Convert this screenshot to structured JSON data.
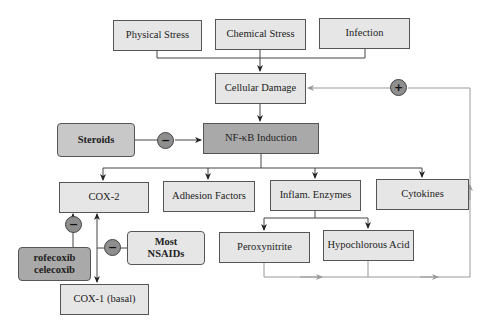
{
  "diagram": {
    "nodes": {
      "physical_stress": "Physical Stress",
      "chemical_stress": "Chemical Stress",
      "infection": "Infection",
      "cellular_damage": "Cellular Damage",
      "nfkb": "NF-κB Induction",
      "steroids": "Steroids",
      "cox2": "COX-2",
      "adhesion": "Adhesion Factors",
      "enzymes": "Inflam. Enzymes",
      "cytokines": "Cytokines",
      "coxibs_line1": "rofecoxib",
      "coxibs_line2": "celecoxib",
      "nsaids_line1": "Most",
      "nsaids_line2": "NSAIDs",
      "peroxynitrite": "Peroxynitrite",
      "hypochlorous": "Hypochlorous Acid",
      "cox1": "COX-1 (basal)"
    },
    "signs": {
      "positive": "+",
      "negative": "−"
    },
    "edges": [
      {
        "from": "Physical Stress",
        "to": "Cellular Damage",
        "type": "activation"
      },
      {
        "from": "Chemical Stress",
        "to": "Cellular Damage",
        "type": "activation"
      },
      {
        "from": "Infection",
        "to": "Cellular Damage",
        "type": "activation"
      },
      {
        "from": "Cellular Damage",
        "to": "NF-κB Induction",
        "type": "activation"
      },
      {
        "from": "Steroids",
        "to": "NF-κB Induction",
        "type": "inhibition"
      },
      {
        "from": "NF-κB Induction",
        "to": "COX-2",
        "type": "activation"
      },
      {
        "from": "NF-κB Induction",
        "to": "Adhesion Factors",
        "type": "activation"
      },
      {
        "from": "NF-κB Induction",
        "to": "Inflam. Enzymes",
        "type": "activation"
      },
      {
        "from": "NF-κB Induction",
        "to": "Cytokines",
        "type": "activation"
      },
      {
        "from": "Inflam. Enzymes",
        "to": "Peroxynitrite",
        "type": "activation"
      },
      {
        "from": "Inflam. Enzymes",
        "to": "Hypochlorous Acid",
        "type": "activation"
      },
      {
        "from": "rofecoxib celecoxib",
        "to": "COX-2",
        "type": "inhibition"
      },
      {
        "from": "Most NSAIDs",
        "to": "COX-2 / COX-1 (basal)",
        "type": "inhibition"
      },
      {
        "from": "Peroxynitrite / Hypochlorous Acid",
        "to": "Cellular Damage",
        "type": "positive feedback"
      }
    ],
    "colors": {
      "box_fill": "#e6e6e6",
      "dark_fill": "#a9a9a9",
      "circle_fill": "#8e8e8e",
      "line": "#333333",
      "feedback_line": "#999999"
    }
  }
}
